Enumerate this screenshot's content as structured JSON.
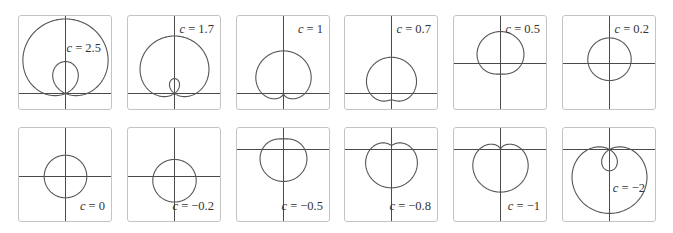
{
  "chart_data": {
    "type": "polar-curve-grid",
    "title": "",
    "equation": "r = 1 + c sin θ",
    "layout": {
      "rows": 2,
      "cols": 6,
      "grid": false,
      "axes": "crosshair"
    },
    "unit_px": 21.3,
    "panels": [
      {
        "c": 2.5,
        "label_var": "c",
        "label_eq": " = 2.5",
        "label_pos": "middle-right",
        "axis_y": 77
      },
      {
        "c": 1.7,
        "label_var": "c",
        "label_eq": " = 1.7",
        "label_pos": "top-right",
        "axis_y": 77
      },
      {
        "c": 1,
        "label_var": "c",
        "label_eq": " = 1",
        "label_pos": "top-right",
        "axis_y": 77
      },
      {
        "c": 0.7,
        "label_var": "c",
        "label_eq": " = 0.7",
        "label_pos": "top-right",
        "axis_y": 77
      },
      {
        "c": 0.5,
        "label_var": "c",
        "label_eq": " = 0.5",
        "label_pos": "top-right",
        "axis_y": 47
      },
      {
        "c": 0.2,
        "label_var": "c",
        "label_eq": " = 0.2",
        "label_pos": "top-right",
        "axis_y": 47
      },
      {
        "c": 0,
        "label_var": "c",
        "label_eq": " = 0",
        "label_pos": "bottom-right",
        "axis_y": 48
      },
      {
        "c": -0.2,
        "label_var": "c",
        "label_eq": " = −0.2",
        "label_pos": "bottom-right",
        "axis_y": 48
      },
      {
        "c": -0.5,
        "label_var": "c",
        "label_eq": " = −0.5",
        "label_pos": "bottom-right",
        "axis_y": 21
      },
      {
        "c": -0.8,
        "label_var": "c",
        "label_eq": " = −0.8",
        "label_pos": "bottom-right",
        "axis_y": 21
      },
      {
        "c": -1,
        "label_var": "c",
        "label_eq": " = −1",
        "label_pos": "bottom-right",
        "axis_y": 21
      },
      {
        "c": -2,
        "label_var": "c",
        "label_eq": " = −2",
        "label_pos": "middle-right",
        "axis_y": 21
      }
    ]
  }
}
